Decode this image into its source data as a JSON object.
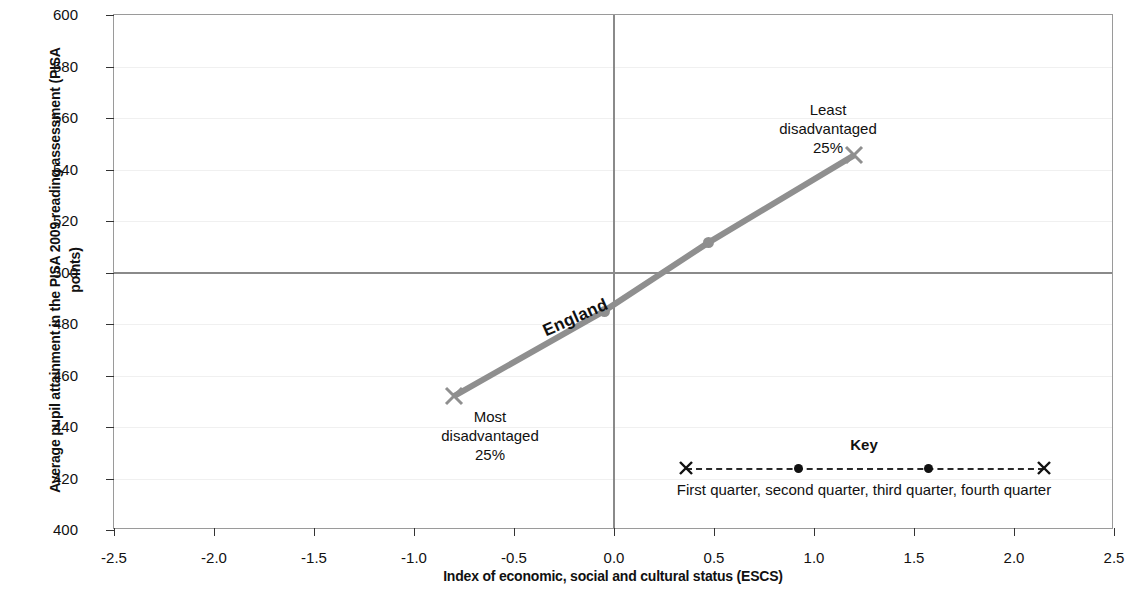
{
  "chart_data": {
    "type": "line",
    "title": "",
    "xlabel": "Index of economic, social and cultural status (ESCS)",
    "ylabel": "Average pupil attainment in the PISA 2009 reading assessment (PISA points)",
    "xlim": [
      -2.5,
      2.5
    ],
    "ylim": [
      400,
      600
    ],
    "xticks": [
      "-2.5",
      "-2.0",
      "-1.5",
      "-1.0",
      "-0.5",
      "0.0",
      "0.5",
      "1.0",
      "1.5",
      "2.0",
      "2.5"
    ],
    "xtick_values": [
      -2.5,
      -2.0,
      -1.5,
      -1.0,
      -0.5,
      0.0,
      0.5,
      1.0,
      1.5,
      2.0,
      2.5
    ],
    "yticks": [
      "400",
      "420",
      "440",
      "460",
      "480",
      "500",
      "520",
      "540",
      "560",
      "580",
      "600"
    ],
    "ytick_values": [
      400,
      420,
      440,
      460,
      480,
      500,
      520,
      540,
      560,
      580,
      600
    ],
    "grid": false,
    "legend_position": "inside-bottom-right",
    "series": [
      {
        "name": "England",
        "color": "#8f8f8f",
        "x": [
          -0.8,
          -0.05,
          0.47,
          1.2
        ],
        "y": [
          452,
          485,
          511.5,
          545.5
        ],
        "markers": [
          "x",
          "dot",
          "dot",
          "x"
        ],
        "point_labels": [
          "First quarter",
          "second quarter",
          "third quarter",
          "fourth quarter"
        ]
      }
    ],
    "reference_lines": [
      {
        "orientation": "horizontal",
        "value": 500,
        "color": "#8a8a8a"
      },
      {
        "orientation": "vertical",
        "value": 0.0,
        "color": "#8a8a8a"
      }
    ],
    "annotations": [
      {
        "text": "Least\ndisadvantaged\n25%",
        "x": 1.07,
        "y": 563,
        "align": "center"
      },
      {
        "text": "Most\ndisadvantaged\n25%",
        "x": -0.62,
        "y": 444,
        "align": "center"
      },
      {
        "text": "England",
        "x": -0.33,
        "y": 481,
        "rotated": true
      }
    ]
  },
  "axes": {
    "y_title": "Average pupil attainment in the PISA 2009 reading assessment (PISA points)",
    "x_title": "Index of economic, social and cultural status (ESCS)"
  },
  "annotations": {
    "least": "Least\ndisadvantaged\n25%",
    "most": "Most\ndisadvantaged\n25%",
    "series_label": "England"
  },
  "key": {
    "title": "Key",
    "caption": "First quarter,  second quarter,  third quarter,  fourth quarter",
    "markers": [
      "x",
      "dot",
      "dot",
      "x"
    ]
  }
}
